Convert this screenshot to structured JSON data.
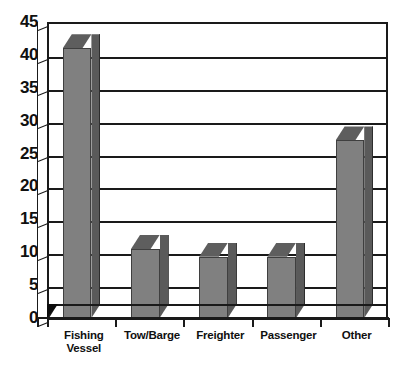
{
  "chart_data": {
    "type": "bar",
    "title": "",
    "subtitle": "",
    "xlabel": "",
    "ylabel": "",
    "categories": [
      "Fishing Vessel",
      "Tow/Barge",
      "Freighter",
      "Passenger",
      "Other"
    ],
    "values": [
      41,
      10.5,
      9.3,
      9.3,
      27
    ],
    "ylim": [
      0,
      45
    ],
    "ytick_labels": [
      "45",
      "40",
      "35",
      "30",
      "25",
      "20",
      "15",
      "10",
      "5",
      "0"
    ],
    "ytick_values": [
      45,
      40,
      35,
      30,
      25,
      20,
      15,
      10,
      5,
      0
    ],
    "grid": "horizontal",
    "legend": "none",
    "style": "3d-column",
    "bar_face_color": "#808080",
    "bar_side_color": "#5a5a5a",
    "bar_top_color": "#5e5e5e",
    "axis_color": "#1a1a1a",
    "background_color": "#ffffff"
  },
  "axes": {
    "y_ticks": [
      {
        "label": "45",
        "value": 45
      },
      {
        "label": "40",
        "value": 40
      },
      {
        "label": "35",
        "value": 35
      },
      {
        "label": "30",
        "value": 30
      },
      {
        "label": "25",
        "value": 25
      },
      {
        "label": "20",
        "value": 20
      },
      {
        "label": "15",
        "value": 15
      },
      {
        "label": "10",
        "value": 10
      },
      {
        "label": "5",
        "value": 5
      },
      {
        "label": "0",
        "value": 0
      }
    ],
    "x_categories": [
      {
        "label_line1": "Fishing",
        "label_line2": "Vessel"
      },
      {
        "label_line1": "Tow/Barge",
        "label_line2": ""
      },
      {
        "label_line1": "Freighter",
        "label_line2": ""
      },
      {
        "label_line1": "Passenger",
        "label_line2": ""
      },
      {
        "label_line1": "Other",
        "label_line2": ""
      }
    ]
  }
}
